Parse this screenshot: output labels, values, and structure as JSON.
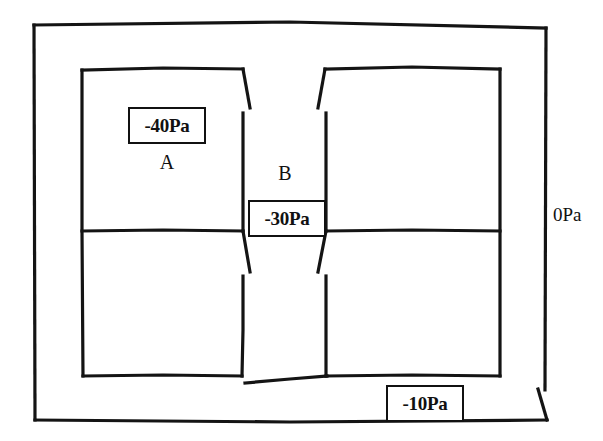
{
  "diagram": {
    "type": "floor-plan",
    "units": "Pa",
    "stroke_color": "#111111",
    "background_color": "#ffffff",
    "labels": {
      "outer_envelope_pressure": "0Pa",
      "room_a_pressure": "-40Pa",
      "room_a_name": "A",
      "corridor_b_name": "B",
      "corridor_b_pressure": "-30Pa",
      "vestibule_pressure": "-10Pa"
    },
    "zones": [
      {
        "id": "outer",
        "name": "outer ambient",
        "pressure": "0Pa"
      },
      {
        "id": "room-a",
        "name": "A",
        "pressure": "-40Pa"
      },
      {
        "id": "corridor-b",
        "name": "B",
        "pressure": "-30Pa"
      },
      {
        "id": "vestibule",
        "name": "entry vestibule",
        "pressure": "-10Pa"
      }
    ]
  }
}
